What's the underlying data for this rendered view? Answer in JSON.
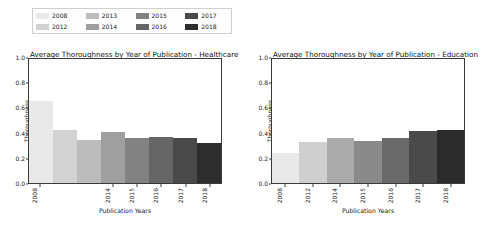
{
  "figure": {
    "background": "#ffffff",
    "axis_color": "#3a3a3a",
    "text_color": "#1a1a1a"
  },
  "panels": [
    {
      "id": "healthcare",
      "legend": {
        "items": [
          {
            "label": "2008",
            "color": "#e9e9e9"
          },
          {
            "label": "2012",
            "color": "#d2d2d2"
          },
          {
            "label": "2013",
            "color": "#bcbcbc"
          },
          {
            "label": "2014",
            "color": "#9f9f9f"
          },
          {
            "label": "2015",
            "color": "#828282"
          },
          {
            "label": "2016",
            "color": "#666666"
          },
          {
            "label": "2017",
            "color": "#494949"
          },
          {
            "label": "2018",
            "color": "#2d2d2d"
          }
        ]
      },
      "chart_data": {
        "type": "bar",
        "title": "Average Thoroughness by Year of Publication - Healthcare",
        "xlabel": "Publication Years",
        "ylabel": "Thoroughness",
        "categories": [
          "2008",
          "2012",
          "2013",
          "2014",
          "2015",
          "2016",
          "2017",
          "2018"
        ],
        "values": [
          0.66,
          0.43,
          0.35,
          0.41,
          0.36,
          0.37,
          0.36,
          0.32
        ],
        "colors": [
          "#e9e9e9",
          "#d2d2d2",
          "#bcbcbc",
          "#9f9f9f",
          "#828282",
          "#666666",
          "#494949",
          "#2d2d2d"
        ],
        "ylim": [
          0.0,
          1.0
        ],
        "yticks": [
          "0.0",
          "0.2",
          "0.4",
          "0.6",
          "0.8",
          "1.0"
        ],
        "ytick_values": [
          0.0,
          0.2,
          0.4,
          0.6,
          0.8,
          1.0
        ],
        "visible_xticks": [
          "2008",
          "2014",
          "2015",
          "2016",
          "2017",
          "2018"
        ],
        "visible_xtick_index": [
          0,
          3,
          4,
          5,
          6,
          7
        ],
        "grid": false,
        "legend_position": "above"
      }
    },
    {
      "id": "education",
      "legend": {
        "items": [
          {
            "label": "2008",
            "color": "#e9e9e9"
          },
          {
            "label": "2012",
            "color": "#cfcfcf"
          },
          {
            "label": "2014",
            "color": "#ababab"
          },
          {
            "label": "2015",
            "color": "#8a8a8a"
          },
          {
            "label": "2016",
            "color": "#6a6a6a"
          },
          {
            "label": "2017",
            "color": "#4a4a4a"
          },
          {
            "label": "2018",
            "color": "#2b2b2b"
          }
        ]
      },
      "chart_data": {
        "type": "bar",
        "title": "Average Thoroughness by Year of Publication - Education",
        "xlabel": "Publication Years",
        "ylabel": "Thoroughness",
        "categories": [
          "2008",
          "2012",
          "2014",
          "2015",
          "2016",
          "2017",
          "2018"
        ],
        "values": [
          0.24,
          0.33,
          0.36,
          0.34,
          0.365,
          0.42,
          0.425
        ],
        "colors": [
          "#e9e9e9",
          "#cfcfcf",
          "#ababab",
          "#8a8a8a",
          "#6a6a6a",
          "#4a4a4a",
          "#2b2b2b"
        ],
        "ylim": [
          0.0,
          1.0
        ],
        "yticks": [
          "0.0",
          "0.2",
          "0.4",
          "0.6",
          "0.8",
          "1.0"
        ],
        "ytick_values": [
          0.0,
          0.2,
          0.4,
          0.6,
          0.8,
          1.0
        ],
        "visible_xticks": [
          "2008",
          "2012",
          "2014",
          "2015",
          "2016",
          "2017",
          "2018"
        ],
        "visible_xtick_index": [
          0,
          1,
          2,
          3,
          4,
          5,
          6
        ],
        "grid": false,
        "legend_position": "above"
      }
    }
  ]
}
